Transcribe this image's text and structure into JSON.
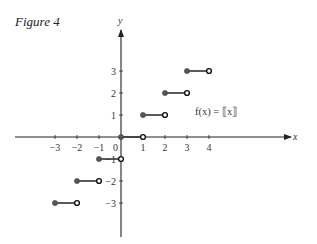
{
  "figure": {
    "title": "Figure 4",
    "function_label": "f(x) = ⟦x⟧",
    "x_axis_label": "x",
    "y_axis_label": "y"
  },
  "chart_data": {
    "type": "line",
    "title": "Figure 4",
    "subtitle": "",
    "annotation": "f(x) = ⟦x⟧",
    "xlabel": "x",
    "ylabel": "y",
    "x_ticks": [
      -3,
      -2,
      -1,
      0,
      1,
      2,
      3,
      4
    ],
    "y_ticks": [
      -3,
      -2,
      -1,
      1,
      2,
      3
    ],
    "xlim": [
      -4,
      7.7
    ],
    "ylim": [
      -4.6,
      4.8
    ],
    "grid": false,
    "legend": "none",
    "segments": [
      {
        "x_start": -3,
        "x_end": -2,
        "y": -3,
        "left": "closed",
        "right": "open"
      },
      {
        "x_start": -2,
        "x_end": -1,
        "y": -2,
        "left": "closed",
        "right": "open"
      },
      {
        "x_start": -1,
        "x_end": 0,
        "y": -1,
        "left": "closed",
        "right": "open"
      },
      {
        "x_start": 0,
        "x_end": 1,
        "y": 0,
        "left": "closed",
        "right": "open"
      },
      {
        "x_start": 1,
        "x_end": 2,
        "y": 1,
        "left": "closed",
        "right": "open"
      },
      {
        "x_start": 2,
        "x_end": 3,
        "y": 2,
        "left": "closed",
        "right": "open"
      },
      {
        "x_start": 3,
        "x_end": 4,
        "y": 3,
        "left": "closed",
        "right": "open"
      }
    ]
  }
}
